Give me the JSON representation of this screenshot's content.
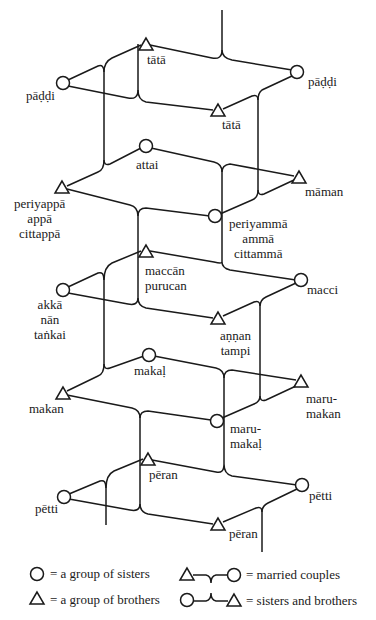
{
  "diagram": {
    "type": "kinship-diagram",
    "generations": [
      {
        "level": "grandparents",
        "nodes": [
          {
            "id": "paddi-left",
            "shape": "circle",
            "label": "pāḍḍi"
          },
          {
            "id": "tata-top",
            "shape": "triangle",
            "label": "tātā"
          },
          {
            "id": "paddi-right",
            "shape": "circle",
            "label": "pāḍḍi"
          },
          {
            "id": "tata-bottom",
            "shape": "triangle",
            "label": "tātā"
          }
        ]
      },
      {
        "level": "parents",
        "nodes": [
          {
            "id": "attai",
            "shape": "circle",
            "label": "attai"
          },
          {
            "id": "periyappa",
            "shape": "triangle",
            "label": "periyappā\nappā\ncittappā"
          },
          {
            "id": "periyamma",
            "shape": "circle",
            "label": "periyammā\nammā\ncittammā"
          },
          {
            "id": "maman",
            "shape": "triangle",
            "label": "māman"
          }
        ]
      },
      {
        "level": "ego",
        "nodes": [
          {
            "id": "maccan",
            "shape": "triangle",
            "label": "maccān\npurucan"
          },
          {
            "id": "akka",
            "shape": "circle",
            "label": "akkā\nnān\ntaṅkai"
          },
          {
            "id": "macci",
            "shape": "circle",
            "label": "macci"
          },
          {
            "id": "annan",
            "shape": "triangle",
            "label": "aṇṇan\ntampi"
          }
        ]
      },
      {
        "level": "children",
        "nodes": [
          {
            "id": "makal",
            "shape": "circle",
            "label": "makaḷ"
          },
          {
            "id": "makan",
            "shape": "triangle",
            "label": "makan"
          },
          {
            "id": "marumakan",
            "shape": "triangle",
            "label": "maru-\nmakan"
          },
          {
            "id": "marumakal",
            "shape": "circle",
            "label": "maru-\nmakaḷ"
          }
        ]
      },
      {
        "level": "grandchildren",
        "nodes": [
          {
            "id": "peran-top",
            "shape": "triangle",
            "label": "pēran"
          },
          {
            "id": "petti-left",
            "shape": "circle",
            "label": "pētti"
          },
          {
            "id": "petti-right",
            "shape": "circle",
            "label": "pētti"
          },
          {
            "id": "peran-bottom",
            "shape": "triangle",
            "label": "pēran"
          }
        ]
      }
    ]
  },
  "legend": {
    "sisters": "= a group of sisters",
    "brothers": "= a group of brothers",
    "married": "= married couples",
    "siblings": "= sisters and brothers"
  }
}
